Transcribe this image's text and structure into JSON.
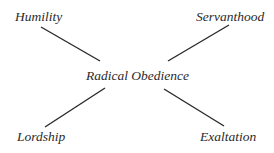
{
  "diagram": {
    "center": {
      "label": "Radical Obedience"
    },
    "nodes": [
      {
        "position": "top-left",
        "label": "Humility"
      },
      {
        "position": "top-right",
        "label": "Servanthood"
      },
      {
        "position": "bottom-left",
        "label": "Lordship"
      },
      {
        "position": "bottom-right",
        "label": "Exaltation"
      }
    ],
    "line_color": "#2a2a2a",
    "text_color": "#2a2a2a"
  }
}
